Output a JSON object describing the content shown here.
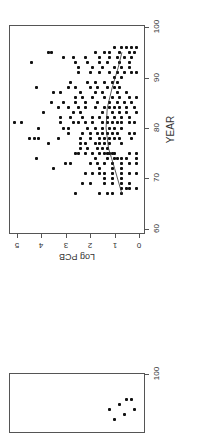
{
  "chart_data": [
    {
      "type": "scatter",
      "orientation": "rotated 90deg clockwise (x axis vertical on right, y axis horizontal on bottom)",
      "title": "",
      "xlabel": "YEAR",
      "ylabel": "Log PCB",
      "xlim": [
        60,
        100
      ],
      "ylim": [
        0,
        5
      ],
      "x_ticks": [
        "60",
        "70",
        "80",
        "90",
        "100"
      ],
      "y_ticks": [
        "0",
        "1",
        "2",
        "3",
        "4",
        "5"
      ],
      "grid": false,
      "legend": null,
      "trend_line": [
        [
          67,
          0.7
        ],
        [
          72,
          1.0
        ],
        [
          76,
          1.25
        ],
        [
          80,
          1.35
        ],
        [
          84,
          1.3
        ],
        [
          88,
          1.1
        ],
        [
          92,
          0.85
        ],
        [
          95,
          0.7
        ]
      ],
      "points": [
        [
          67,
          2.6
        ],
        [
          67,
          1.6
        ],
        [
          67,
          1.3
        ],
        [
          67,
          1.1
        ],
        [
          67,
          0.7
        ],
        [
          68,
          0.7
        ],
        [
          68,
          0.5
        ],
        [
          68,
          0.4
        ],
        [
          68,
          0.1
        ],
        [
          69,
          2.3
        ],
        [
          69,
          2.0
        ],
        [
          69,
          1.4
        ],
        [
          69,
          1.1
        ],
        [
          69,
          0.7
        ],
        [
          69,
          0.4
        ],
        [
          70,
          1.4
        ],
        [
          70,
          1.1
        ],
        [
          70,
          0.7
        ],
        [
          71,
          2.2
        ],
        [
          71,
          1.9
        ],
        [
          71,
          1.6
        ],
        [
          71,
          1.4
        ],
        [
          71,
          1.1
        ],
        [
          71,
          0.7
        ],
        [
          71,
          0.4
        ],
        [
          71,
          0.1
        ],
        [
          72,
          3.5
        ],
        [
          72,
          1.6
        ],
        [
          72,
          1.1
        ],
        [
          72,
          0.7
        ],
        [
          73,
          3.0
        ],
        [
          73,
          2.8
        ],
        [
          73,
          2.0
        ],
        [
          73,
          1.7
        ],
        [
          73,
          1.4
        ],
        [
          73,
          1.1
        ],
        [
          73,
          0.7
        ],
        [
          73,
          0.4
        ],
        [
          73,
          0.1
        ],
        [
          74,
          4.2
        ],
        [
          74,
          1.8
        ],
        [
          74,
          1.3
        ],
        [
          74,
          1.0
        ],
        [
          74,
          0.9
        ],
        [
          74,
          0.7
        ],
        [
          74,
          0.5
        ],
        [
          74,
          0.1
        ],
        [
          75,
          2.6
        ],
        [
          75,
          2.5
        ],
        [
          75,
          2.2
        ],
        [
          75,
          1.9
        ],
        [
          75,
          1.6
        ],
        [
          75,
          1.4
        ],
        [
          75,
          1.3
        ],
        [
          75,
          1.2
        ],
        [
          75,
          1.1
        ],
        [
          75,
          1.0
        ],
        [
          75,
          0.4
        ],
        [
          75,
          0.1
        ],
        [
          76,
          2.4
        ],
        [
          76,
          2.1
        ],
        [
          76,
          1.7
        ],
        [
          76,
          1.5
        ],
        [
          76,
          1.3
        ],
        [
          77,
          3.7
        ],
        [
          77,
          2.4
        ],
        [
          77,
          2.2
        ],
        [
          77,
          1.8
        ],
        [
          77,
          1.6
        ],
        [
          77,
          1.4
        ],
        [
          77,
          1.2
        ],
        [
          77,
          0.7
        ],
        [
          78,
          4.5
        ],
        [
          78,
          4.3
        ],
        [
          78,
          4.1
        ],
        [
          78,
          3.3
        ],
        [
          78,
          2.4
        ],
        [
          78,
          2.0
        ],
        [
          78,
          1.6
        ],
        [
          78,
          1.4
        ],
        [
          78,
          1.2
        ],
        [
          78,
          1.0
        ],
        [
          78,
          0.8
        ],
        [
          78,
          0.3
        ],
        [
          79,
          2.9
        ],
        [
          79,
          2.3
        ],
        [
          79,
          2.0
        ],
        [
          79,
          1.7
        ],
        [
          79,
          1.5
        ],
        [
          79,
          1.3
        ],
        [
          79,
          1.1
        ],
        [
          79,
          0.9
        ],
        [
          79,
          0.4
        ],
        [
          79,
          0.2
        ],
        [
          80,
          4.1
        ],
        [
          80,
          3.1
        ],
        [
          80,
          2.9
        ],
        [
          80,
          2.1
        ],
        [
          80,
          1.8
        ],
        [
          80,
          1.5
        ],
        [
          80,
          1.2
        ],
        [
          80,
          1.0
        ],
        [
          80,
          0.7
        ],
        [
          81,
          5.1
        ],
        [
          81,
          4.8
        ],
        [
          81,
          3.2
        ],
        [
          81,
          2.7
        ],
        [
          81,
          2.5
        ],
        [
          81,
          2.2
        ],
        [
          81,
          1.9
        ],
        [
          81,
          1.5
        ],
        [
          81,
          1.3
        ],
        [
          81,
          1.1
        ],
        [
          81,
          0.9
        ],
        [
          81,
          0.7
        ],
        [
          81,
          0.4
        ],
        [
          81,
          0.2
        ],
        [
          82,
          3.2
        ],
        [
          82,
          2.8
        ],
        [
          82,
          2.3
        ],
        [
          82,
          1.9
        ],
        [
          82,
          1.6
        ],
        [
          82,
          1.3
        ],
        [
          82,
          1.0
        ],
        [
          82,
          0.7
        ],
        [
          82,
          0.4
        ],
        [
          83,
          3.9
        ],
        [
          83,
          2.7
        ],
        [
          83,
          2.4
        ],
        [
          83,
          1.5
        ],
        [
          83,
          1.1
        ],
        [
          83,
          0.8
        ],
        [
          83,
          0.5
        ],
        [
          83,
          0.1
        ],
        [
          84,
          3.3
        ],
        [
          84,
          2.9
        ],
        [
          84,
          2.5
        ],
        [
          84,
          2.2
        ],
        [
          84,
          1.8
        ],
        [
          84,
          1.4
        ],
        [
          84,
          1.2
        ],
        [
          84,
          1.0
        ],
        [
          84,
          0.8
        ],
        [
          84,
          0.5
        ],
        [
          84,
          0.2
        ],
        [
          85,
          3.6
        ],
        [
          85,
          3.1
        ],
        [
          85,
          2.6
        ],
        [
          85,
          2.2
        ],
        [
          85,
          1.7
        ],
        [
          85,
          1.2
        ],
        [
          85,
          0.9
        ],
        [
          85,
          0.6
        ],
        [
          85,
          0.3
        ],
        [
          86,
          2.6
        ],
        [
          86,
          2.3
        ],
        [
          86,
          1.9
        ],
        [
          86,
          1.4
        ],
        [
          86,
          1.1
        ],
        [
          86,
          0.8
        ],
        [
          86,
          0.4
        ],
        [
          86,
          0.1
        ],
        [
          87,
          3.5
        ],
        [
          87,
          3.2
        ],
        [
          87,
          2.4
        ],
        [
          87,
          1.8
        ],
        [
          87,
          1.5
        ],
        [
          87,
          0.9
        ],
        [
          87,
          0.5
        ],
        [
          88,
          4.2
        ],
        [
          88,
          2.9
        ],
        [
          88,
          2.6
        ],
        [
          88,
          2.0
        ],
        [
          88,
          1.7
        ],
        [
          88,
          1.3
        ],
        [
          88,
          1.0
        ],
        [
          88,
          0.8
        ],
        [
          89,
          2.8
        ],
        [
          89,
          2.1
        ],
        [
          89,
          1.8
        ],
        [
          89,
          1.4
        ],
        [
          89,
          1.1
        ],
        [
          89,
          0.9
        ],
        [
          90,
          1.0
        ],
        [
          90,
          0.7
        ],
        [
          91,
          2.5
        ],
        [
          91,
          2.0
        ],
        [
          91,
          1.6
        ],
        [
          91,
          1.2
        ],
        [
          91,
          0.9
        ],
        [
          91,
          0.6
        ],
        [
          91,
          0.3
        ],
        [
          91,
          0.1
        ],
        [
          92,
          2.5
        ],
        [
          92,
          1.9
        ],
        [
          92,
          1.5
        ],
        [
          92,
          1.0
        ],
        [
          92,
          0.7
        ],
        [
          92,
          0.4
        ],
        [
          93,
          4.4
        ],
        [
          93,
          2.6
        ],
        [
          93,
          2.1
        ],
        [
          93,
          1.6
        ],
        [
          93,
          1.3
        ],
        [
          93,
          0.8
        ],
        [
          93,
          0.4
        ],
        [
          94,
          3.1
        ],
        [
          94,
          2.7
        ],
        [
          94,
          2.2
        ],
        [
          94,
          1.6
        ],
        [
          94,
          1.2
        ],
        [
          94,
          0.9
        ],
        [
          94,
          0.6
        ],
        [
          94,
          0.3
        ],
        [
          95,
          3.7
        ],
        [
          95,
          3.6
        ],
        [
          95,
          1.8
        ],
        [
          95,
          1.4
        ],
        [
          95,
          1.2
        ],
        [
          95,
          0.8
        ],
        [
          95,
          0.4
        ],
        [
          95,
          0.2
        ],
        [
          96,
          1.0
        ],
        [
          96,
          0.7
        ],
        [
          96,
          0.5
        ],
        [
          96,
          0.3
        ],
        [
          96,
          0.1
        ]
      ]
    },
    {
      "type": "scatter",
      "orientation": "rotated 90deg clockwise (partially visible, cropped at bottom)",
      "x_ticks": [
        "100"
      ],
      "points_visible": [
        [
          95,
          0.3
        ],
        [
          95,
          0.5
        ],
        [
          94,
          0.8
        ],
        [
          93,
          1.2
        ],
        [
          93,
          0.2
        ],
        [
          92,
          0.6
        ],
        [
          91,
          1.0
        ],
        [
          90,
          0.2
        ]
      ]
    }
  ],
  "labels": {
    "year_axis_title": "YEAR",
    "pcb_axis_title": "Log PCB",
    "year_ticks": [
      "60",
      "70",
      "80",
      "90",
      "100"
    ],
    "pcb_ticks": [
      "0",
      "1",
      "2",
      "3",
      "4",
      "5"
    ],
    "second_plot_tick": "100"
  },
  "colors": {
    "point": "#111111",
    "frame": "#555555",
    "background": "#ffffff"
  }
}
